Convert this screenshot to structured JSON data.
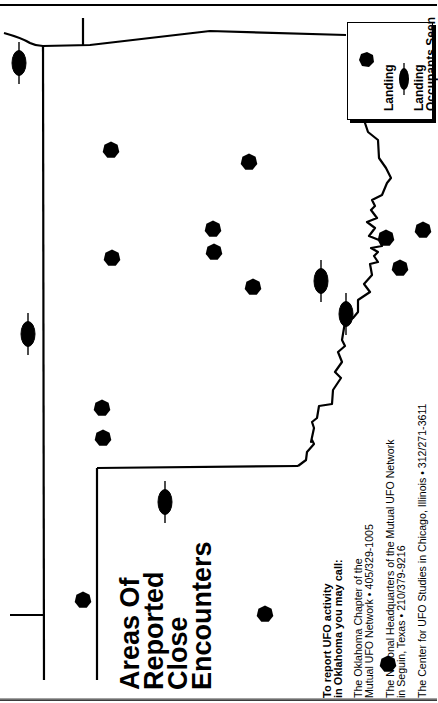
{
  "map": {
    "title_lines": [
      "Areas Of",
      "Reported",
      "Close",
      "Encounters"
    ],
    "orientation": "rotated 90° counter-clockwise (Oklahoma)",
    "legend": {
      "items": [
        {
          "symbol": "hexagon",
          "label_lines": [
            "Landing"
          ]
        },
        {
          "symbol": "ellipse-with-line",
          "label_lines": [
            "Landing",
            "Occupants Seen"
          ]
        }
      ]
    },
    "markers": {
      "landing": [
        {
          "x": 111,
          "y": 150
        },
        {
          "x": 249,
          "y": 162
        },
        {
          "x": 213,
          "y": 229
        },
        {
          "x": 214,
          "y": 252
        },
        {
          "x": 112,
          "y": 258
        },
        {
          "x": 253,
          "y": 287
        },
        {
          "x": 386,
          "y": 238
        },
        {
          "x": 423,
          "y": 230
        },
        {
          "x": 400,
          "y": 268
        },
        {
          "x": 102,
          "y": 408
        },
        {
          "x": 103,
          "y": 438
        },
        {
          "x": 83,
          "y": 600
        },
        {
          "x": 265,
          "y": 614
        },
        {
          "x": 388,
          "y": 664
        }
      ],
      "occupants_seen": [
        {
          "x": 19,
          "y": 63
        },
        {
          "x": 28,
          "y": 334
        },
        {
          "x": 321,
          "y": 281
        },
        {
          "x": 346,
          "y": 314
        },
        {
          "x": 165,
          "y": 502
        }
      ]
    },
    "report_info": {
      "header_lines": [
        "To report UFO activity",
        "in Oklahoma you may call:"
      ],
      "entries": [
        {
          "lines": [
            "The Oklahoma Chapter of the",
            "Mutual UFO Network • 405/329-1005"
          ]
        },
        {
          "lines": [
            "The National Headquarters of the Mutual UFO Network",
            "in Seguin, Texas • 210/379-9216"
          ]
        },
        {
          "lines": [
            "The Center for UFO Studies in Chicago, Illinois • 312/271-3611"
          ]
        }
      ]
    },
    "colors": {
      "ink": "#000000",
      "paper": "#ffffff"
    }
  }
}
